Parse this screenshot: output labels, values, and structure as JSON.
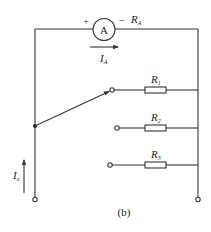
{
  "diagram": {
    "caption": "(b)",
    "ammeter": {
      "symbol": "A",
      "plus_sign": "+",
      "minus_sign": "−",
      "resistance_label": "R",
      "resistance_sub": "A",
      "current_label": "I",
      "current_sub": "A"
    },
    "input_current": {
      "label": "I",
      "sub": "x"
    },
    "resistors": [
      {
        "label": "R",
        "sub": "1"
      },
      {
        "label": "R",
        "sub": "2"
      },
      {
        "label": "R",
        "sub": "3"
      }
    ],
    "colors": {
      "line": "#333333",
      "background": "#ffffff"
    }
  }
}
